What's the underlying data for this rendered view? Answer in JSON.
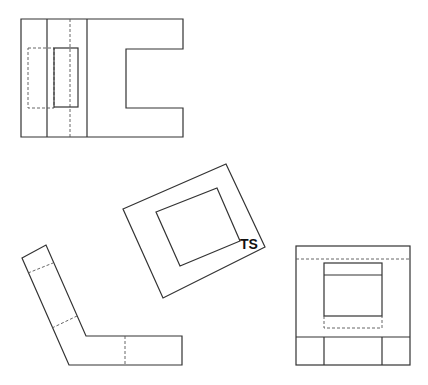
{
  "drawing": {
    "type": "orthographic-projection",
    "views": [
      {
        "name": "top-view"
      },
      {
        "name": "auxiliary-view",
        "label": "TS"
      },
      {
        "name": "front-view"
      },
      {
        "name": "side-view"
      }
    ],
    "ts_label": "TS",
    "line_color": "#333333"
  }
}
